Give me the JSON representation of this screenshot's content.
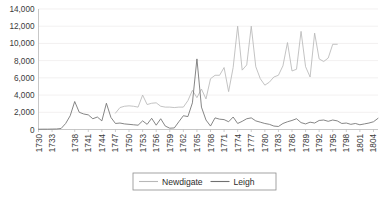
{
  "chart_data": {
    "type": "line",
    "title": "",
    "xlabel": "",
    "ylabel": "",
    "ylim": [
      0,
      14000
    ],
    "xlim": [
      1730,
      1805
    ],
    "grid": true,
    "legend_position": "bottom",
    "y_ticks": [
      "0",
      "2,000",
      "4,000",
      "6,000",
      "8,000",
      "10,000",
      "12,000",
      "14,000"
    ],
    "y_tick_values": [
      0,
      2000,
      4000,
      6000,
      8000,
      10000,
      12000,
      14000
    ],
    "x_ticks": [
      "1730",
      "1733",
      "1738",
      "1741",
      "1744",
      "1747",
      "1750",
      "1753",
      "1756",
      "1759",
      "1762",
      "1765",
      "1768",
      "1771",
      "1774",
      "1777",
      "1780",
      "1783",
      "1786",
      "1789",
      "1792",
      "1795",
      "1798",
      "1801",
      "1804"
    ],
    "x_tick_values": [
      1730,
      1733,
      1738,
      1741,
      1744,
      1747,
      1750,
      1753,
      1756,
      1759,
      1762,
      1765,
      1768,
      1771,
      1774,
      1777,
      1780,
      1783,
      1786,
      1789,
      1792,
      1795,
      1798,
      1801,
      1804
    ],
    "series": [
      {
        "name": "Newdigate",
        "color": "#b8b8b8",
        "x": [
          1747,
          1748,
          1749,
          1750,
          1751,
          1752,
          1753,
          1754,
          1755,
          1756,
          1757,
          1758,
          1759,
          1760,
          1761,
          1762,
          1763,
          1764,
          1765,
          1766,
          1767,
          1768,
          1769,
          1770,
          1771,
          1772,
          1773,
          1774,
          1775,
          1776,
          1777,
          1778,
          1779,
          1780,
          1781,
          1782,
          1783,
          1784,
          1785,
          1786,
          1787,
          1788,
          1789,
          1790,
          1791,
          1792,
          1793,
          1794,
          1795,
          1796
        ],
        "values": [
          1900,
          2550,
          2700,
          2750,
          2700,
          2600,
          4000,
          2900,
          3050,
          3100,
          2700,
          2600,
          2600,
          2550,
          2600,
          2600,
          3350,
          4550,
          3700,
          4700,
          3550,
          5900,
          6300,
          6300,
          7200,
          4400,
          7200,
          12000,
          6900,
          7500,
          12000,
          7300,
          5900,
          5150,
          5500,
          6100,
          6300,
          7400,
          10100,
          6800,
          7000,
          11400,
          7300,
          6100,
          11200,
          8200,
          7900,
          8300,
          9900,
          9900
        ]
      },
      {
        "name": "Leigh",
        "color": "#707070",
        "x": [
          1730,
          1731,
          1732,
          1733,
          1734,
          1735,
          1736,
          1737,
          1738,
          1739,
          1740,
          1741,
          1742,
          1743,
          1744,
          1745,
          1746,
          1747,
          1748,
          1749,
          1750,
          1751,
          1752,
          1753,
          1754,
          1755,
          1756,
          1757,
          1758,
          1759,
          1760,
          1761,
          1762,
          1763,
          1764,
          1765,
          1766,
          1767,
          1768,
          1769,
          1770,
          1771,
          1772,
          1773,
          1774,
          1775,
          1776,
          1777,
          1778,
          1779,
          1780,
          1781,
          1782,
          1783,
          1784,
          1785,
          1786,
          1787,
          1788,
          1789,
          1790,
          1791,
          1792,
          1793,
          1794,
          1795,
          1796,
          1797,
          1798,
          1799,
          1800,
          1801,
          1802,
          1803,
          1804,
          1805
        ],
        "values": [
          30,
          40,
          40,
          50,
          60,
          120,
          700,
          1600,
          3250,
          2000,
          1800,
          1700,
          1250,
          1450,
          1000,
          3050,
          1400,
          700,
          750,
          650,
          600,
          550,
          500,
          1000,
          600,
          1300,
          500,
          1250,
          400,
          150,
          180,
          900,
          1600,
          1500,
          3100,
          8200,
          2600,
          1100,
          400,
          1350,
          1200,
          1150,
          900,
          1450,
          700,
          950,
          1250,
          1350,
          1000,
          850,
          700,
          600,
          400,
          350,
          700,
          900,
          1050,
          1250,
          800,
          650,
          850,
          750,
          1050,
          1100,
          950,
          1100,
          1000,
          700,
          750,
          600,
          700,
          550,
          650,
          750,
          900,
          1300
        ]
      }
    ]
  },
  "legend": {
    "items": [
      {
        "label": "Newdigate",
        "color": "#b8b8b8"
      },
      {
        "label": "Leigh",
        "color": "#707070"
      }
    ]
  }
}
